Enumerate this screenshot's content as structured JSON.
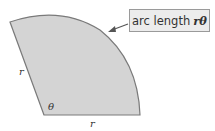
{
  "diagram": {
    "callout": {
      "text": "arc length",
      "symbol": "rθ"
    },
    "labels": {
      "radius_left": "r",
      "radius_bottom": "r",
      "angle": "θ"
    },
    "colors": {
      "fill": "#d4d4d4",
      "stroke": "#7a7a7a",
      "arrow": "#555555",
      "callout_bg": "#ececec"
    }
  }
}
